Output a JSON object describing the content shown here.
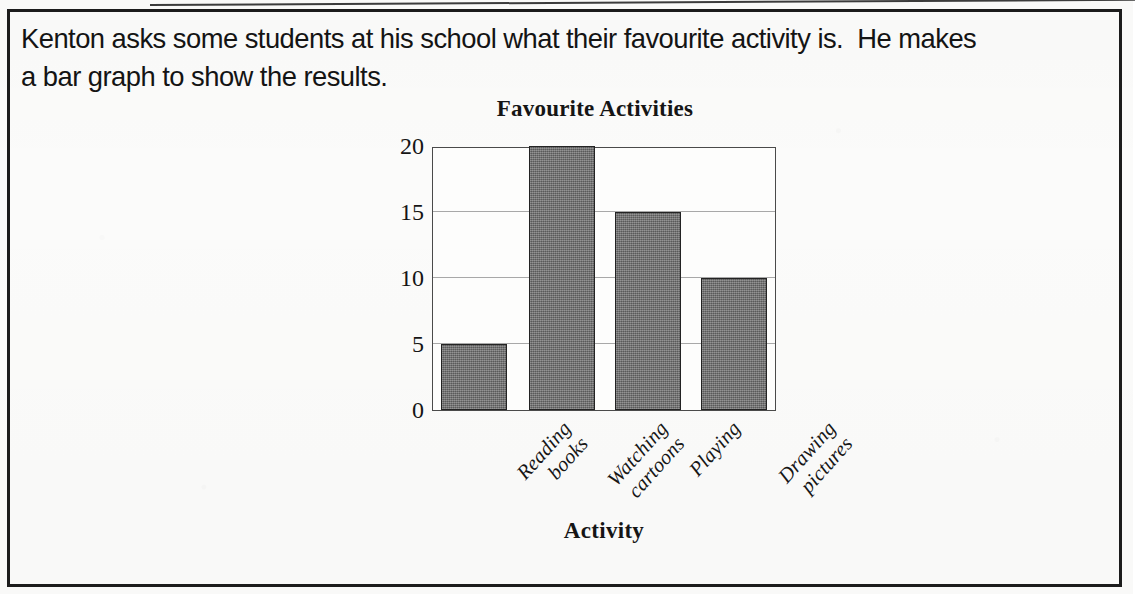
{
  "worksheet": {
    "prompt_line_1": "Kenton asks some students at his school what their favourite activity is.  He makes",
    "prompt_line_2": "a bar graph to show the results."
  },
  "chart_data": {
    "type": "bar",
    "title": "Favourite Activities",
    "xlabel": "Activity",
    "ylabel": "Number of students",
    "categories": [
      "Reading books",
      "Watching cartoons",
      "Playing",
      "Drawing pictures"
    ],
    "category_lines": [
      [
        "Reading",
        "books"
      ],
      [
        "Watching",
        "cartoons"
      ],
      [
        "Playing"
      ],
      [
        "Drawing",
        "pictures"
      ]
    ],
    "values": [
      5,
      20,
      15,
      10
    ],
    "ylim": [
      0,
      20
    ],
    "yticks": [
      0,
      5,
      10,
      15,
      20
    ],
    "ytick_labels": [
      "0",
      "5",
      "10",
      "15",
      "20"
    ],
    "grid": true,
    "legend": "none",
    "bar_fill": "#6c6c6c",
    "bar_edge": "#232323",
    "gridline_color": "#a8a8a8",
    "axis_color": "#4a4a4a"
  }
}
